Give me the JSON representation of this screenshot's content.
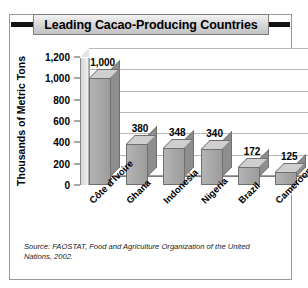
{
  "figure": {
    "title": "Leading Cacao-Producing Countries",
    "source_note": "Source: FAOSTAT, Food and Agriculture Organization of the United Nations, 2002."
  },
  "chart_data": {
    "type": "bar",
    "title": "Leading Cacao-Producing Countries",
    "categories": [
      "Côte d'Ivoire",
      "Ghana",
      "Indonesia",
      "Nigeria",
      "Brazil",
      "Cameroon"
    ],
    "values": [
      1000,
      380,
      348,
      340,
      172,
      125
    ],
    "data_labels": [
      "1,000",
      "380",
      "348",
      "340",
      "172",
      "125"
    ],
    "xlabel": "",
    "ylabel": "Thousands of Metric Tons",
    "ylim": [
      0,
      1200
    ],
    "ytick_values": [
      0,
      200,
      400,
      600,
      800,
      1000,
      1200
    ],
    "ytick_labels": [
      "0",
      "200",
      "400",
      "600",
      "800",
      "1,000",
      "1,200"
    ],
    "grid": true,
    "legend": false,
    "style": "3d-column",
    "bar_color": "#a6a6a6",
    "bar_edge_color": "#6f6f6f",
    "plot_background": "#ffffff"
  }
}
